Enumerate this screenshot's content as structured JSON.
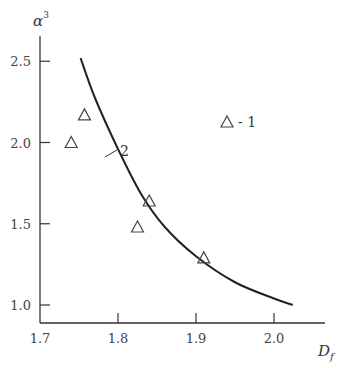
{
  "chart_data": {
    "type": "scatter",
    "title": "",
    "xlabel": "D_f",
    "ylabel": "α³",
    "xlim": [
      1.7,
      2.06
    ],
    "ylim": [
      0.9,
      2.7
    ],
    "xticks": [
      1.7,
      1.8,
      1.9,
      2.0
    ],
    "xtick_labels": [
      "1.7",
      "1.8",
      "1.9",
      "2.0"
    ],
    "yticks": [
      1.0,
      1.5,
      2.0,
      2.5
    ],
    "ytick_labels": [
      "1.0",
      "1.5",
      "2.0",
      "2.5"
    ],
    "grid": false,
    "legend": {
      "position": "upper right",
      "entries": [
        "△ - 1"
      ]
    },
    "series": [
      {
        "name": "1",
        "kind": "scatter",
        "marker": "open-triangle",
        "points": [
          {
            "x": 1.74,
            "y": 2.0
          },
          {
            "x": 1.757,
            "y": 2.17
          },
          {
            "x": 1.825,
            "y": 1.48
          },
          {
            "x": 1.84,
            "y": 1.64
          },
          {
            "x": 1.91,
            "y": 1.29
          }
        ]
      },
      {
        "name": "2",
        "kind": "line",
        "points": [
          {
            "x": 1.752,
            "y": 2.52
          },
          {
            "x": 1.77,
            "y": 2.28
          },
          {
            "x": 1.8,
            "y": 1.96
          },
          {
            "x": 1.83,
            "y": 1.68
          },
          {
            "x": 1.86,
            "y": 1.48
          },
          {
            "x": 1.9,
            "y": 1.3
          },
          {
            "x": 1.95,
            "y": 1.14
          },
          {
            "x": 2.0,
            "y": 1.04
          },
          {
            "x": 2.024,
            "y": 1.0
          }
        ]
      }
    ],
    "annotations": [
      {
        "text": "2",
        "target": "curve",
        "x": 1.78,
        "y": 2.1
      },
      {
        "text": "- 1",
        "target": "legend"
      }
    ]
  },
  "labels": {
    "y_axis_title": "α",
    "y_axis_superscript": "3",
    "x_axis_title": "D",
    "x_axis_subscript": "f",
    "curve_label": "2",
    "legend_text": "- 1"
  }
}
